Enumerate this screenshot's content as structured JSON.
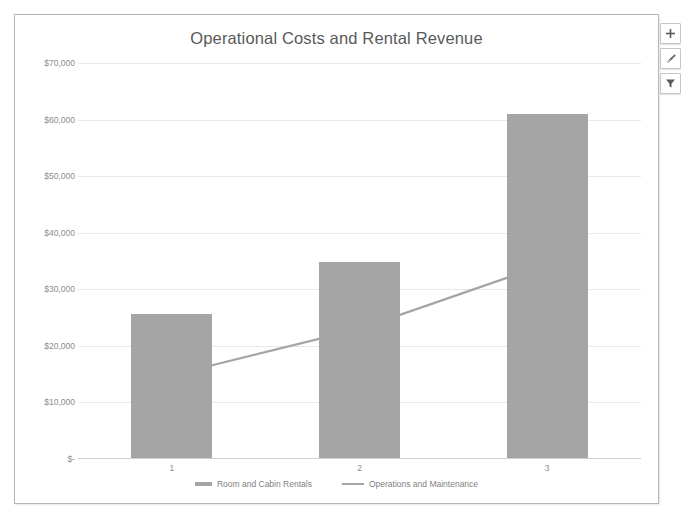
{
  "chart_data": {
    "type": "bar",
    "title": "Operational Costs and Rental Revenue",
    "xlabel": "",
    "ylabel": "",
    "categories": [
      "1",
      "2",
      "3"
    ],
    "ylim": [
      0,
      70000
    ],
    "ytick_labels": [
      "$70,000",
      "$60,000",
      "$50,000",
      "$40,000",
      "$30,000",
      "$20,000",
      "$10,000",
      "$-"
    ],
    "ytick_values": [
      70000,
      60000,
      50000,
      40000,
      30000,
      20000,
      10000,
      0
    ],
    "grid": true,
    "legend_position": "bottom",
    "series": [
      {
        "name": "Room and Cabin Rentals",
        "type": "bar",
        "color": "#A5A5A5",
        "values": [
          25700,
          34800,
          60900
        ]
      },
      {
        "name": "Operations and Maintenance",
        "type": "line",
        "color": "#A5A5A5",
        "values": [
          14800,
          23000,
          34500
        ]
      }
    ]
  },
  "chart": {
    "title": "Operational Costs and Rental Revenue"
  },
  "legend": {
    "items": [
      {
        "label": "Room and Cabin Rentals",
        "marker": "bar"
      },
      {
        "label": "Operations and Maintenance",
        "marker": "line"
      }
    ]
  },
  "buttons": [
    {
      "name": "chart-elements-button",
      "icon": "plus-icon",
      "title": "Chart Elements"
    },
    {
      "name": "chart-styles-button",
      "icon": "paintbrush-icon",
      "title": "Chart Styles"
    },
    {
      "name": "chart-filters-button",
      "icon": "funnel-icon",
      "title": "Chart Filters"
    }
  ]
}
